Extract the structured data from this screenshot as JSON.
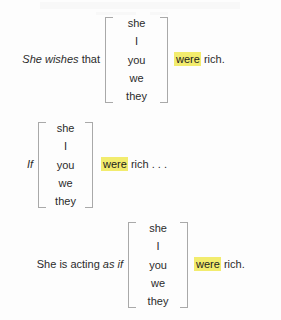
{
  "page": {
    "background_color": "#fdfdfd",
    "text_color": "#2b2b2b",
    "highlight_color": "#f2ec6e",
    "bracket_color": "#a9a9a9"
  },
  "pronoun_list": [
    "she",
    "I",
    "you",
    "we",
    "they"
  ],
  "examples": [
    {
      "id": "she-wishes-that",
      "lead_italic": "She wishes",
      "lead_roman": "that",
      "highlight": "were",
      "tail": "rich.",
      "stack": [
        "she",
        "I",
        "you",
        "we",
        "they"
      ]
    },
    {
      "id": "if",
      "lead_italic": "If",
      "lead_roman": "",
      "highlight": "were",
      "tail": "rich . . .",
      "stack": [
        "she",
        "I",
        "you",
        "we",
        "they"
      ]
    },
    {
      "id": "she-is-acting-as-if",
      "lead_roman": "She is acting",
      "lead_italic": "as if",
      "highlight": "were",
      "tail": "rich.",
      "stack": [
        "she",
        "I",
        "you",
        "we",
        "they"
      ]
    }
  ]
}
